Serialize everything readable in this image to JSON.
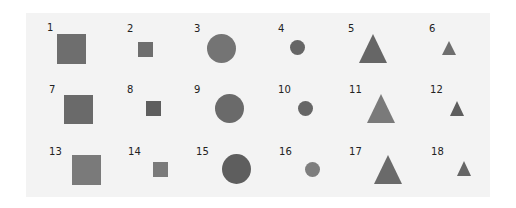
{
  "figure": {
    "panel_color": "#f3f3f3",
    "items": [
      {
        "label": "1",
        "shape": "square",
        "size": "large",
        "color": "#6e6e6e",
        "lx": 47,
        "ly": 23,
        "x": 57,
        "y": 34,
        "w": 29,
        "h": 30
      },
      {
        "label": "2",
        "shape": "square",
        "size": "small",
        "color": "#6e6e6e",
        "lx": 127,
        "ly": 24,
        "x": 138,
        "y": 42,
        "w": 15,
        "h": 15
      },
      {
        "label": "3",
        "shape": "circle",
        "size": "large",
        "color": "#747474",
        "lx": 194,
        "ly": 24,
        "x": 207,
        "y": 34,
        "w": 29,
        "h": 29
      },
      {
        "label": "4",
        "shape": "circle",
        "size": "small",
        "color": "#666666",
        "lx": 278,
        "ly": 24,
        "x": 290,
        "y": 40,
        "w": 15,
        "h": 15
      },
      {
        "label": "5",
        "shape": "triangle",
        "size": "large",
        "color": "#666666",
        "lx": 348,
        "ly": 24,
        "x": 359,
        "y": 34,
        "w": 28,
        "h": 29
      },
      {
        "label": "6",
        "shape": "triangle",
        "size": "small",
        "color": "#6e6e6e",
        "lx": 429,
        "ly": 24,
        "x": 442,
        "y": 41,
        "w": 14,
        "h": 14
      },
      {
        "label": "7",
        "shape": "square",
        "size": "large",
        "color": "#6a6a6a",
        "lx": 49,
        "ly": 85,
        "x": 64,
        "y": 95,
        "w": 29,
        "h": 29
      },
      {
        "label": "8",
        "shape": "square",
        "size": "small",
        "color": "#5e5e5e",
        "lx": 127,
        "ly": 85,
        "x": 146,
        "y": 101,
        "w": 15,
        "h": 15
      },
      {
        "label": "9",
        "shape": "circle",
        "size": "large",
        "color": "#6a6a6a",
        "lx": 194,
        "ly": 85,
        "x": 215,
        "y": 94,
        "w": 29,
        "h": 29
      },
      {
        "label": "10",
        "shape": "circle",
        "size": "small",
        "color": "#666666",
        "lx": 278,
        "ly": 85,
        "x": 298,
        "y": 101,
        "w": 15,
        "h": 15
      },
      {
        "label": "11",
        "shape": "triangle",
        "size": "large",
        "color": "#7a7a7a",
        "lx": 349,
        "ly": 85,
        "x": 367,
        "y": 94,
        "w": 28,
        "h": 29
      },
      {
        "label": "12",
        "shape": "triangle",
        "size": "small",
        "color": "#5e5e5e",
        "lx": 430,
        "ly": 85,
        "x": 450,
        "y": 101,
        "w": 14,
        "h": 15
      },
      {
        "label": "13",
        "shape": "square",
        "size": "large",
        "color": "#7a7a7a",
        "lx": 49,
        "ly": 147,
        "x": 72,
        "y": 155,
        "w": 29,
        "h": 30
      },
      {
        "label": "14",
        "shape": "square",
        "size": "small",
        "color": "#7a7a7a",
        "lx": 128,
        "ly": 147,
        "x": 153,
        "y": 162,
        "w": 15,
        "h": 15
      },
      {
        "label": "15",
        "shape": "circle",
        "size": "large",
        "color": "#5e5e5e",
        "lx": 196,
        "ly": 147,
        "x": 222,
        "y": 154,
        "w": 29,
        "h": 30
      },
      {
        "label": "16",
        "shape": "circle",
        "size": "small",
        "color": "#7e7e7e",
        "lx": 279,
        "ly": 147,
        "x": 305,
        "y": 162,
        "w": 15,
        "h": 15
      },
      {
        "label": "17",
        "shape": "triangle",
        "size": "large",
        "color": "#6a6a6a",
        "lx": 349,
        "ly": 147,
        "x": 374,
        "y": 155,
        "w": 28,
        "h": 29
      },
      {
        "label": "18",
        "shape": "triangle",
        "size": "small",
        "color": "#666666",
        "lx": 431,
        "ly": 147,
        "x": 457,
        "y": 161,
        "w": 14,
        "h": 15
      }
    ]
  }
}
